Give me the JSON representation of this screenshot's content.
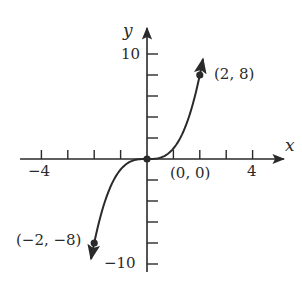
{
  "chart_data": {
    "type": "line",
    "title": "",
    "function": "y = x^3",
    "xlabel": "x",
    "ylabel": "y",
    "xlim": [
      -4,
      4
    ],
    "ylim": [
      -10,
      10
    ],
    "x_ticks": [
      -4,
      -3,
      -2,
      -1,
      1,
      2,
      3,
      4
    ],
    "x_tick_labels": [
      "-4",
      "4"
    ],
    "y_ticks": [
      -10,
      -8,
      -6,
      -4,
      -2,
      2,
      4,
      6,
      8,
      10
    ],
    "y_tick_labels": [
      "10",
      "-10"
    ],
    "grid": false,
    "series": [
      {
        "name": "y = x^3",
        "x": [
          -2.1,
          -2,
          -1.5,
          -1,
          -0.5,
          0,
          0.5,
          1,
          1.5,
          2,
          2.1
        ],
        "y": [
          -9.26,
          -8,
          -3.375,
          -1,
          -0.125,
          0,
          0.125,
          1,
          3.375,
          8,
          9.26
        ]
      }
    ],
    "points": [
      {
        "x": -2,
        "y": -8,
        "label": "(−2, −8)"
      },
      {
        "x": 0,
        "y": 0,
        "label": "(0, 0)"
      },
      {
        "x": 2,
        "y": 8,
        "label": "(2, 8)"
      }
    ],
    "color": "#2a2a2a"
  },
  "labels": {
    "x_axis": "x",
    "y_axis": "y",
    "x_min": "−4",
    "x_max": "4",
    "y_max": "10",
    "y_min": "−10",
    "pt_neg": "(−2, −8)",
    "pt_origin": "(0, 0)",
    "pt_pos": "(2, 8)"
  }
}
